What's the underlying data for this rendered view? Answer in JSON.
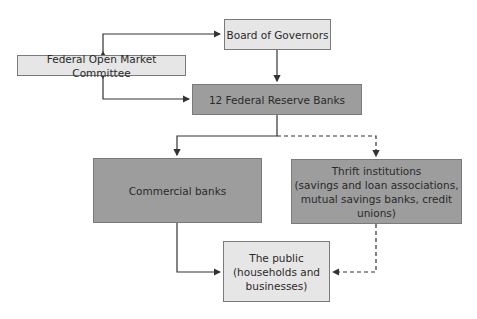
{
  "diagram": {
    "colors": {
      "light_box": "#e6e6e6",
      "dark_box": "#9d9d9d",
      "line": "#333333"
    },
    "nodes": {
      "board": {
        "label": "Board of Governors"
      },
      "fomc": {
        "label": "Federal Open Market Committee"
      },
      "frb": {
        "label": "12 Federal Reserve Banks"
      },
      "commercial": {
        "label": "Commercial banks"
      },
      "thrift": {
        "line1": "Thrift institutions",
        "line2": "(savings and loan associations,",
        "line3": "mutual savings banks, credit unions)"
      },
      "public": {
        "line1": "The public",
        "line2": "(households and",
        "line3": "businesses)"
      }
    },
    "edges": [
      {
        "from": "fomc",
        "to": "board",
        "style": "solid",
        "direction": "both"
      },
      {
        "from": "fomc",
        "to": "frb",
        "style": "solid",
        "direction": "both"
      },
      {
        "from": "board",
        "to": "frb",
        "style": "solid"
      },
      {
        "from": "frb",
        "to": "commercial",
        "style": "solid"
      },
      {
        "from": "frb",
        "to": "thrift",
        "style": "dashed"
      },
      {
        "from": "commercial",
        "to": "public",
        "style": "solid"
      },
      {
        "from": "thrift",
        "to": "public",
        "style": "dashed"
      }
    ]
  }
}
